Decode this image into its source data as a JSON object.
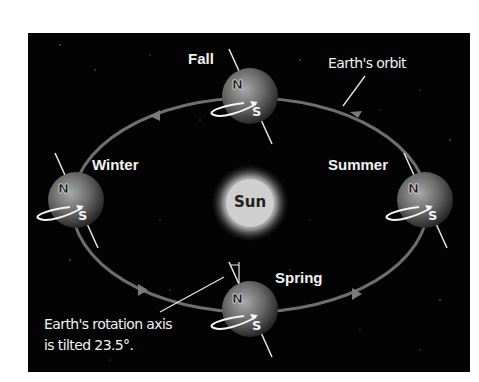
{
  "diagram": {
    "central_body": {
      "label": "Sun"
    },
    "orbit": {
      "label": "Earth's orbit",
      "direction": "counterclockwise"
    },
    "seasons": [
      {
        "label": "Fall",
        "position": "top",
        "north": "N",
        "south": "S"
      },
      {
        "label": "Winter",
        "position": "left",
        "north": "N",
        "south": "S"
      },
      {
        "label": "Summer",
        "position": "right",
        "north": "N",
        "south": "S"
      },
      {
        "label": "Spring",
        "position": "bottom",
        "north": "N",
        "south": "S"
      }
    ],
    "annotation": {
      "line1": "Earth's rotation axis",
      "line2": "is tilted 23.5°."
    },
    "colors": {
      "background": "#030303",
      "orbit": "#6e6e6e",
      "text": "#f2f2f2"
    }
  }
}
